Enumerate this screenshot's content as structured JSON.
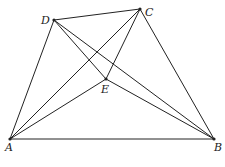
{
  "diagram": {
    "points": {
      "A": {
        "label": "A",
        "x": 10,
        "y": 139
      },
      "B": {
        "label": "B",
        "x": 214,
        "y": 139
      },
      "C": {
        "label": "C",
        "x": 140,
        "y": 9
      },
      "D": {
        "label": "D",
        "x": 54,
        "y": 20
      },
      "E": {
        "label": "E",
        "x": 106,
        "y": 79
      }
    },
    "segments": [
      [
        "A",
        "B"
      ],
      [
        "A",
        "D"
      ],
      [
        "D",
        "C"
      ],
      [
        "C",
        "B"
      ],
      [
        "A",
        "C"
      ],
      [
        "D",
        "B"
      ],
      [
        "D",
        "E"
      ],
      [
        "E",
        "B"
      ],
      [
        "A",
        "E"
      ],
      [
        "E",
        "C"
      ]
    ]
  }
}
